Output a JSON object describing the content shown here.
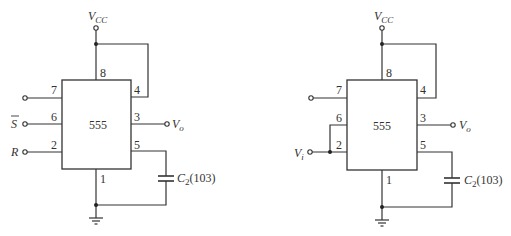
{
  "circuits": [
    {
      "id": "left",
      "chip_label": "555",
      "pins": {
        "p1": "1",
        "p2": "2",
        "p3": "3",
        "p4": "4",
        "p5": "5",
        "p6": "6",
        "p7": "7",
        "p8": "8"
      },
      "vcc_main": "V",
      "vcc_sub": "CC",
      "out_main": "V",
      "out_sub": "o",
      "in6_label": "S",
      "in2_label": "R",
      "cap_main": "C",
      "cap_sub": "2",
      "cap_value": "(103)"
    },
    {
      "id": "right",
      "chip_label": "555",
      "pins": {
        "p1": "1",
        "p2": "2",
        "p3": "3",
        "p4": "4",
        "p5": "5",
        "p6": "6",
        "p7": "7",
        "p8": "8"
      },
      "vcc_main": "V",
      "vcc_sub": "CC",
      "out_main": "V",
      "out_sub": "o",
      "in_main": "V",
      "in_sub": "i",
      "cap_main": "C",
      "cap_sub": "2",
      "cap_value": "(103)"
    }
  ]
}
